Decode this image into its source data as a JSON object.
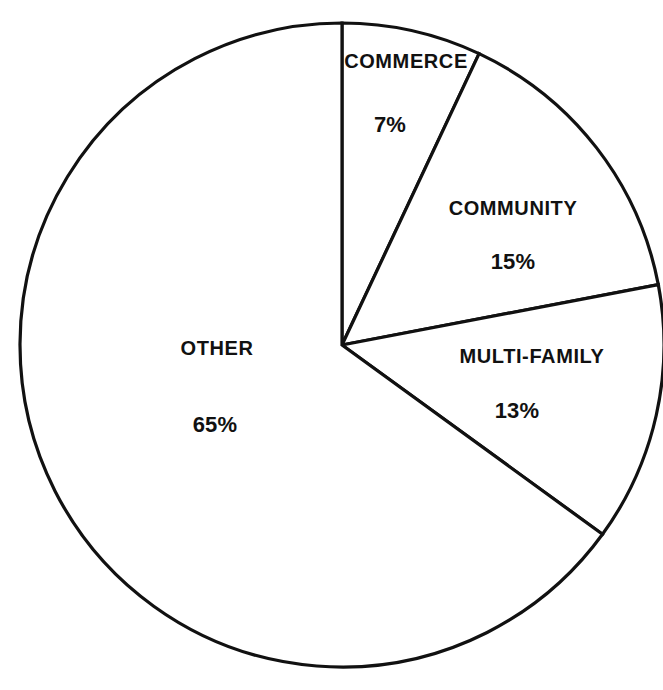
{
  "chart_data": {
    "type": "pie",
    "title": "",
    "subtitle": "",
    "xlabel": "",
    "ylabel": "",
    "grid": false,
    "legend_position": "none",
    "label_style": "inside-slice",
    "units": "percent",
    "total": 100,
    "start_angle_deg": 0,
    "direction": "clockwise",
    "categories": [
      "COMMERCE",
      "COMMUNITY",
      "MULTI-FAMILY",
      "OTHER"
    ],
    "values": [
      7,
      15,
      13,
      65
    ],
    "value_labels": [
      "7%",
      "15%",
      "13%",
      "65%"
    ],
    "slices": [
      {
        "name": "COMMERCE",
        "value": 7,
        "value_label": "7%",
        "start_deg": 0,
        "end_deg": 25.2,
        "fill": "#ffffff",
        "stroke": "#111111",
        "label_x": 406,
        "label_y": 61,
        "value_x": 390,
        "value_y": 125
      },
      {
        "name": "COMMUNITY",
        "value": 15,
        "value_label": "15%",
        "start_deg": 25.2,
        "end_deg": 79.2,
        "fill": "#ffffff",
        "stroke": "#111111",
        "label_x": 513,
        "label_y": 208,
        "value_x": 513,
        "value_y": 262
      },
      {
        "name": "MULTI-FAMILY",
        "value": 13,
        "value_label": "13%",
        "start_deg": 79.2,
        "end_deg": 126.0,
        "fill": "#ffffff",
        "stroke": "#111111",
        "label_x": 532,
        "label_y": 356,
        "value_x": 517,
        "value_y": 411
      },
      {
        "name": "OTHER",
        "value": 65,
        "value_label": "65%",
        "start_deg": 126.0,
        "end_deg": 360.0,
        "fill": "#ffffff",
        "stroke": "#111111",
        "label_x": 217,
        "label_y": 348,
        "value_x": 215,
        "value_y": 425
      }
    ],
    "geometry": {
      "center_x": 342,
      "center_y": 345,
      "radius": 322,
      "stroke_width": 3.2
    },
    "colors": {
      "background": "#ffffff",
      "outline": "#111111",
      "text": "#111111"
    }
  }
}
